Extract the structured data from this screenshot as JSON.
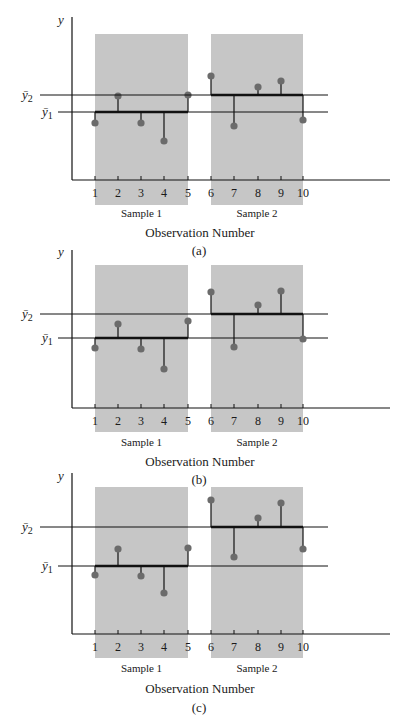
{
  "figure": {
    "panels_count": 3
  },
  "chart_data": [
    {
      "type": "scatter",
      "panel_label": "(a)",
      "title": "",
      "xlabel": "Observation Number",
      "ylabel": "y",
      "x": [
        1,
        2,
        3,
        4,
        5,
        6,
        7,
        8,
        9,
        10
      ],
      "xtick_labels": [
        "1",
        "2",
        "3",
        "4",
        "5",
        "6",
        "7",
        "8",
        "9",
        "10"
      ],
      "groups": [
        {
          "name": "Sample 1",
          "x": [
            1,
            2,
            3,
            4,
            5
          ],
          "values": [
            5.7,
            8.4,
            5.7,
            3.9,
            8.5
          ],
          "mean": 6.8,
          "mean_label": "ȳ1"
        },
        {
          "name": "Sample 2",
          "x": [
            6,
            7,
            8,
            9,
            10
          ],
          "values": [
            10.4,
            5.4,
            9.3,
            9.9,
            6.0
          ],
          "mean": 8.5,
          "mean_label": "ȳ2"
        }
      ],
      "ylim": [
        0,
        16
      ],
      "grid": false,
      "annotations": [
        "deviation stems from each observation to its sample mean",
        "shaded band marks each sample"
      ]
    },
    {
      "type": "scatter",
      "panel_label": "(b)",
      "title": "",
      "xlabel": "Observation Number",
      "ylabel": "y",
      "x": [
        1,
        2,
        3,
        4,
        5,
        6,
        7,
        8,
        9,
        10
      ],
      "xtick_labels": [
        "1",
        "2",
        "3",
        "4",
        "5",
        "6",
        "7",
        "8",
        "9",
        "10"
      ],
      "groups": [
        {
          "name": "Sample 1",
          "x": [
            1,
            2,
            3,
            4,
            5
          ],
          "values": [
            6.0,
            8.4,
            5.9,
            3.9,
            8.7
          ],
          "mean": 7.0,
          "mean_label": "ȳ1"
        },
        {
          "name": "Sample 2",
          "x": [
            6,
            7,
            8,
            9,
            10
          ],
          "values": [
            11.6,
            6.1,
            10.3,
            11.7,
            6.9
          ],
          "mean": 9.4,
          "mean_label": "ȳ2"
        }
      ],
      "ylim": [
        0,
        16
      ],
      "grid": false,
      "annotations": [
        "deviation stems from each observation to its sample mean",
        "shaded band marks each sample"
      ]
    },
    {
      "type": "scatter",
      "panel_label": "(c)",
      "title": "",
      "xlabel": "Observation Number",
      "ylabel": "y",
      "x": [
        1,
        2,
        3,
        4,
        5,
        6,
        7,
        8,
        9,
        10
      ],
      "xtick_labels": [
        "1",
        "2",
        "3",
        "4",
        "5",
        "6",
        "7",
        "8",
        "9",
        "10"
      ],
      "groups": [
        {
          "name": "Sample 1",
          "x": [
            1,
            2,
            3,
            4,
            5
          ],
          "values": [
            5.9,
            8.5,
            5.8,
            4.1,
            8.6
          ],
          "mean": 6.8,
          "mean_label": "ȳ1"
        },
        {
          "name": "Sample 2",
          "x": [
            6,
            7,
            8,
            9,
            10
          ],
          "values": [
            13.4,
            7.7,
            11.6,
            13.1,
            8.5
          ],
          "mean": 10.7,
          "mean_label": "ȳ2"
        }
      ],
      "ylim": [
        0,
        16
      ],
      "grid": false,
      "annotations": [
        "deviation stems from each observation to its sample mean",
        "shaded band marks each sample"
      ]
    }
  ],
  "colors": {
    "shade": "#c6c6c6",
    "point": "#6b6b6b",
    "line": "#111111"
  }
}
